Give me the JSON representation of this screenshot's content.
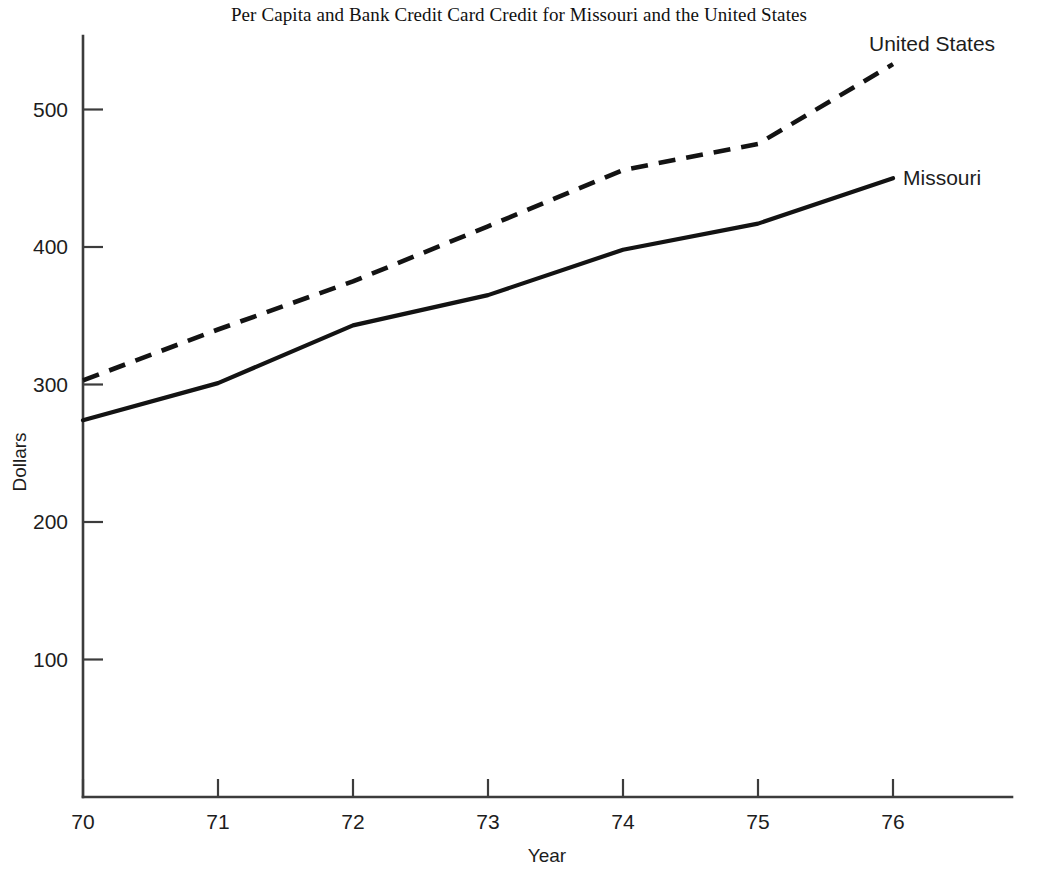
{
  "chart_data": {
    "type": "line",
    "title": "Per Capita and Bank Credit Card Credit for Missouri and the United States",
    "xlabel": "Year",
    "ylabel": "Dollars",
    "x": [
      70,
      71,
      72,
      73,
      74,
      75,
      76
    ],
    "xtick_labels": [
      "70",
      "71",
      "72",
      "73",
      "74",
      "75",
      "76"
    ],
    "ytick_labels": [
      "100",
      "200",
      "300",
      "400",
      "500"
    ],
    "ytick_values": [
      100,
      200,
      300,
      400,
      500
    ],
    "ylim": [
      0,
      560
    ],
    "xlim": [
      70,
      77
    ],
    "grid": false,
    "legend_position": "inline-right-of-line-end",
    "series": [
      {
        "name": "United States",
        "style": "dashed",
        "values": [
          303,
          340,
          375,
          415,
          456,
          475,
          533
        ]
      },
      {
        "name": "Missouri",
        "style": "solid",
        "values": [
          274,
          301,
          343,
          365,
          398,
          417,
          450
        ]
      }
    ]
  },
  "labels": {
    "series_us": "United States",
    "series_mo": "Missouri"
  },
  "axes": {
    "x_title": "Year",
    "y_title": "Dollars",
    "x_ticks": [
      "70",
      "71",
      "72",
      "73",
      "74",
      "75",
      "76"
    ],
    "y_ticks": [
      "100",
      "200",
      "300",
      "400",
      "500"
    ]
  },
  "colors": {
    "background": "#ffffff",
    "line": "#131313",
    "axis": "#3c3c3c",
    "text": "#1d1d1d"
  }
}
